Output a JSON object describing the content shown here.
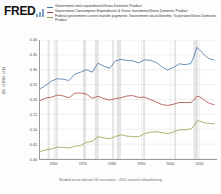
{
  "brand": {
    "name": "FRED",
    "mark": "bar-chart-glyph"
  },
  "legend": {
    "entries": [
      {
        "label": "Government total expenditures/Gross Domestic Product",
        "color": "#4572a7"
      },
      {
        "label": "Government Consumption Expenditures & Gross Investment/Gross Domestic Product",
        "color": "#aa4643"
      },
      {
        "label": "Federal government current transfer payments: Government social benefits: To persons/Gross Domestic Product",
        "color": "#89a54e"
      }
    ]
  },
  "footer": {
    "text": "Shaded areas indicate US recessions - 2015 research.stlouisfed.org"
  },
  "chart_data": {
    "type": "line",
    "title": "",
    "xlabel": "",
    "ylabel": "(Bil. of $/Bil. of $)",
    "xlim": [
      1955,
      2016
    ],
    "ylim": [
      0.0,
      0.4
    ],
    "yticks": [
      "0.40",
      "0.35",
      "0.30",
      "0.25",
      "0.20",
      "0.15",
      "0.10",
      "0.05",
      "0.00"
    ],
    "ytick_values": [
      0.4,
      0.35,
      0.3,
      0.25,
      0.2,
      0.15,
      0.1,
      0.05,
      0.0
    ],
    "xticks": [
      "1960",
      "1970",
      "1980",
      "1990",
      "2000",
      "2010"
    ],
    "xtick_values": [
      1960,
      1970,
      1980,
      1990,
      2000,
      2010
    ],
    "grid": true,
    "legend_position": "top",
    "recessions": [
      [
        1957.6,
        1958.3
      ],
      [
        1960.3,
        1961.1
      ],
      [
        1969.9,
        1970.9
      ],
      [
        1973.9,
        1975.2
      ],
      [
        1980.0,
        1980.5
      ],
      [
        1981.5,
        1982.9
      ],
      [
        1990.5,
        1991.2
      ],
      [
        2001.2,
        2001.9
      ],
      [
        2007.9,
        2009.5
      ]
    ],
    "series": [
      {
        "name": "Government total expenditures/Gross Domestic Product",
        "color": "#4572a7",
        "x": [
          1955,
          1957,
          1959,
          1961,
          1963,
          1965,
          1967,
          1969,
          1971,
          1973,
          1975,
          1977,
          1979,
          1981,
          1983,
          1985,
          1987,
          1989,
          1991,
          1993,
          1995,
          1997,
          1999,
          2001,
          2003,
          2005,
          2007,
          2008,
          2009,
          2010,
          2011,
          2012,
          2013,
          2014,
          2015
        ],
        "y": [
          0.235,
          0.248,
          0.262,
          0.27,
          0.268,
          0.264,
          0.285,
          0.292,
          0.3,
          0.292,
          0.322,
          0.312,
          0.305,
          0.33,
          0.335,
          0.331,
          0.33,
          0.323,
          0.333,
          0.332,
          0.325,
          0.31,
          0.299,
          0.308,
          0.32,
          0.317,
          0.321,
          0.343,
          0.375,
          0.367,
          0.357,
          0.346,
          0.339,
          0.335,
          0.333
        ]
      },
      {
        "name": "Government Consumption Expenditures & Gross Investment/Gross Domestic Product",
        "color": "#aa4643",
        "x": [
          1955,
          1957,
          1959,
          1961,
          1963,
          1965,
          1967,
          1969,
          1971,
          1973,
          1975,
          1977,
          1979,
          1981,
          1983,
          1985,
          1987,
          1989,
          1991,
          1993,
          1995,
          1997,
          1999,
          2001,
          2003,
          2005,
          2007,
          2008,
          2009,
          2010,
          2011,
          2012,
          2013,
          2014,
          2015
        ],
        "y": [
          0.196,
          0.205,
          0.208,
          0.215,
          0.212,
          0.206,
          0.221,
          0.222,
          0.218,
          0.204,
          0.211,
          0.203,
          0.198,
          0.203,
          0.206,
          0.212,
          0.213,
          0.207,
          0.208,
          0.2,
          0.192,
          0.183,
          0.18,
          0.184,
          0.19,
          0.19,
          0.19,
          0.198,
          0.211,
          0.209,
          0.203,
          0.196,
          0.189,
          0.185,
          0.183
        ]
      },
      {
        "name": "Federal government current transfer payments: Government social benefits: To persons/Gross Domestic Product",
        "color": "#89a54e",
        "x": [
          1955,
          1957,
          1959,
          1961,
          1963,
          1965,
          1967,
          1969,
          1971,
          1973,
          1975,
          1977,
          1979,
          1981,
          1983,
          1985,
          1987,
          1989,
          1991,
          1993,
          1995,
          1997,
          1999,
          2001,
          2003,
          2005,
          2007,
          2008,
          2009,
          2010,
          2011,
          2012,
          2013,
          2014,
          2015
        ],
        "y": [
          0.025,
          0.031,
          0.034,
          0.04,
          0.039,
          0.037,
          0.043,
          0.045,
          0.056,
          0.06,
          0.075,
          0.071,
          0.068,
          0.076,
          0.081,
          0.077,
          0.075,
          0.075,
          0.085,
          0.09,
          0.092,
          0.089,
          0.085,
          0.091,
          0.098,
          0.098,
          0.101,
          0.11,
          0.127,
          0.128,
          0.124,
          0.121,
          0.12,
          0.119,
          0.119
        ]
      }
    ]
  }
}
